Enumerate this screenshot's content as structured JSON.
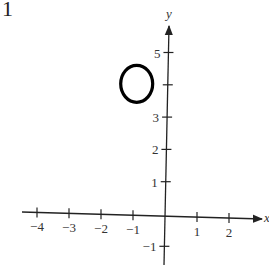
{
  "problem_number": "1",
  "chart_data": {
    "type": "scatter",
    "title": "",
    "xlabel": "x",
    "ylabel": "y",
    "xlim": [
      -4.5,
      2.8
    ],
    "ylim": [
      -1.5,
      5.7
    ],
    "grid": false,
    "x_ticks": [
      -4,
      -3,
      -2,
      -1,
      1,
      2
    ],
    "x_tick_labels": [
      "−4",
      "−3",
      "−2",
      "−1",
      "1",
      "2"
    ],
    "y_ticks": [
      -1,
      1,
      2,
      3,
      4,
      5
    ],
    "y_tick_labels": [
      "−1",
      "1",
      "2",
      "3",
      "",
      "5"
    ],
    "shapes": [
      {
        "kind": "circle",
        "cx": -0.9,
        "cy": 4,
        "r": 0.55,
        "stroke": "#000000",
        "fill": "none"
      }
    ]
  }
}
